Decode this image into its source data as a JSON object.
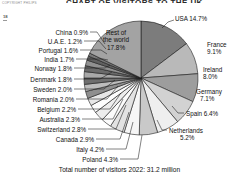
{
  "meta": {
    "copyright": "COPYRIGHT PHILIPS",
    "margin_number": "18",
    "title": "CHART OF VISITORS TO THE UK"
  },
  "chart_data": {
    "type": "pie",
    "title": "CHART OF VISITORS TO THE UK",
    "subtitle": "Total number of visitors 2022: 31.2 million",
    "unit": "%",
    "legend_position": "callout-labels",
    "grid": false,
    "total_label": "Total number of visitors 2022: 31.2 million",
    "center_slice": {
      "name": "Rest of the world",
      "line1": "Rest of",
      "line2": "the world",
      "value": 17.8,
      "label": "17.8%"
    },
    "categories": [
      "USA",
      "France",
      "Ireland",
      "Germany",
      "Spain",
      "Netherlands",
      "Poland",
      "Italy",
      "Canada",
      "Switzerland",
      "Australia",
      "Belgium",
      "Romania",
      "Sweden",
      "Denmark",
      "Norway",
      "India",
      "Portugal",
      "U.A.E.",
      "China",
      "Rest of the world"
    ],
    "values": [
      14.7,
      9.1,
      8.0,
      7.1,
      6.4,
      5.2,
      4.3,
      4.2,
      2.9,
      2.8,
      2.3,
      2.2,
      2.0,
      2.0,
      1.8,
      1.8,
      1.7,
      1.6,
      1.2,
      0.9,
      17.8
    ],
    "slices": [
      {
        "name": "USA",
        "value": 14.7,
        "label": "USA 14.7%",
        "fill": "#7c7c7c"
      },
      {
        "name": "France",
        "value": 9.1,
        "label": "France 9.1%",
        "fill": "#b9b9b9"
      },
      {
        "name": "Ireland",
        "value": 8.0,
        "label": "Ireland 8.0%",
        "fill": "#9d9d9d"
      },
      {
        "name": "Germany",
        "value": 7.1,
        "label": "Germany 7.1%",
        "fill": "#d2d2d2"
      },
      {
        "name": "Spain",
        "value": 6.4,
        "label": "Spain 6.4%",
        "fill": "#efefef"
      },
      {
        "name": "Netherlands",
        "value": 5.2,
        "label": "Netherlands 5.2%",
        "fill": "#c9c9c9"
      },
      {
        "name": "Poland",
        "value": 4.3,
        "label": "Poland 4.3%",
        "fill": "#f6f6f6"
      },
      {
        "name": "Italy",
        "value": 4.2,
        "label": "Italy 4.2%",
        "fill": "#e2e2e2"
      },
      {
        "name": "Canada",
        "value": 2.9,
        "label": "Canada 2.9%",
        "fill": "#fbfbfb"
      },
      {
        "name": "Switzerland",
        "value": 2.8,
        "label": "Switzerland 2.8%",
        "fill": "#ededed"
      },
      {
        "name": "Australia",
        "value": 2.3,
        "label": "Australia 2.3%",
        "fill": "#fdfdfd"
      },
      {
        "name": "Belgium",
        "value": 2.2,
        "label": "Belgium 2.2%",
        "fill": "#e7e7e7"
      },
      {
        "name": "Romania",
        "value": 2.0,
        "label": "Romania 2.0%",
        "fill": "#8f8f8f"
      },
      {
        "name": "Sweden",
        "value": 2.0,
        "label": "Sweden 2.0%",
        "fill": "#bdbdbd"
      },
      {
        "name": "Denmark",
        "value": 1.8,
        "label": "Denmark 1.8%",
        "fill": "#6f6f6f"
      },
      {
        "name": "Norway",
        "value": 1.8,
        "label": "Norway 1.8%",
        "fill": "#a8a8a8"
      },
      {
        "name": "India",
        "value": 1.7,
        "label": "India 1.7%",
        "fill": "#6a6a6a"
      },
      {
        "name": "Portugal",
        "value": 1.6,
        "label": "Portugal 1.6%",
        "fill": "#909090"
      },
      {
        "name": "U.A.E.",
        "value": 1.2,
        "label": "U.A.E. 1.2%",
        "fill": "#606060"
      },
      {
        "name": "China",
        "value": 0.9,
        "label": "China 0.9%",
        "fill": "#7a7a7a"
      },
      {
        "name": "Rest of the world",
        "value": 17.8,
        "label": "Rest of the world 17.8%",
        "fill": "#a3a3a3"
      }
    ]
  }
}
